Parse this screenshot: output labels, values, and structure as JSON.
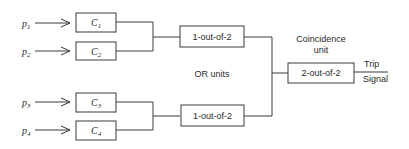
{
  "inputs": [
    {
      "symbol": "p",
      "sub": "1"
    },
    {
      "symbol": "p",
      "sub": "2"
    },
    {
      "symbol": "p",
      "sub": "3"
    },
    {
      "symbol": "p",
      "sub": "4"
    }
  ],
  "channels": [
    {
      "symbol": "C",
      "sub": "1"
    },
    {
      "symbol": "C",
      "sub": "2"
    },
    {
      "symbol": "C",
      "sub": "3"
    },
    {
      "symbol": "C",
      "sub": "4"
    }
  ],
  "or_units": [
    {
      "label": "1-out-of-2"
    },
    {
      "label": "1-out-of-2"
    }
  ],
  "or_units_caption": "OR units",
  "coincidence": {
    "caption_line1": "Coincidence",
    "caption_line2": "unit",
    "label": "2-out-of-2"
  },
  "output": {
    "line1": "Trip",
    "line2": "Signal"
  }
}
